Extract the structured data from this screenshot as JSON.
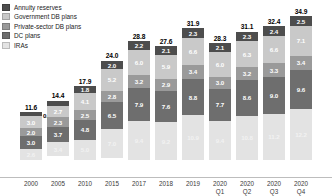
{
  "chart_data": {
    "type": "bar",
    "stacked": true,
    "title": "",
    "subtitle": "",
    "xlabel": "",
    "ylabel": "",
    "ylim": [
      0,
      34.9
    ],
    "grid": false,
    "legend_position": "top-left",
    "categories": [
      "2000",
      "2005",
      "2010",
      "2015",
      "2017",
      "2018",
      "2019",
      "2020\nQ1",
      "2020\nQ2",
      "2020\nQ3",
      "2020\nQ4"
    ],
    "tick_labels": [
      {
        "line1": "2000",
        "line2": ""
      },
      {
        "line1": "2005",
        "line2": ""
      },
      {
        "line1": "2010",
        "line2": ""
      },
      {
        "line1": "2015",
        "line2": ""
      },
      {
        "line1": "2017",
        "line2": ""
      },
      {
        "line1": "2018",
        "line2": ""
      },
      {
        "line1": "2019",
        "line2": ""
      },
      {
        "line1": "2020",
        "line2": "Q1"
      },
      {
        "line1": "2020",
        "line2": "Q2"
      },
      {
        "line1": "2020",
        "line2": "Q3"
      },
      {
        "line1": "2020",
        "line2": "Q4"
      }
    ],
    "totals": [
      11.6,
      14.4,
      17.9,
      24.0,
      28.8,
      27.6,
      31.9,
      28.3,
      31.1,
      32.4,
      34.9
    ],
    "series": [
      {
        "name": "Annuity reserves",
        "color": "#4d4d4d",
        "text_color": "#ffffff",
        "values": [
          0.9,
          1.4,
          1.8,
          2.0,
          2.2,
          2.1,
          2.3,
          2.1,
          2.3,
          2.4,
          2.5
        ]
      },
      {
        "name": "Government DB plans",
        "color": "#c9c9c9",
        "text_color": "#ffffff",
        "values": [
          3.0,
          2.7,
          4.1,
          5.2,
          6.0,
          5.9,
          6.6,
          6.0,
          6.3,
          6.6,
          7.1
        ]
      },
      {
        "name": "Private-sector DB plans",
        "color": "#9a9a9a",
        "text_color": "#ffffff",
        "values": [
          2.0,
          2.3,
          2.5,
          2.8,
          3.2,
          2.9,
          3.4,
          3.0,
          3.2,
          3.3,
          3.4
        ]
      },
      {
        "name": "DC plans",
        "color": "#6e6e6e",
        "text_color": "#ffffff",
        "values": [
          3.0,
          3.7,
          4.8,
          6.5,
          7.9,
          7.6,
          8.8,
          7.7,
          8.6,
          9.0,
          9.6
        ]
      },
      {
        "name": "IRAs",
        "color": "#e3e3e3",
        "text_color": "#f2f2f2",
        "values": [
          2.6,
          3.4,
          5.0,
          7.0,
          9.4,
          9.2,
          10.9,
          9.4,
          10.8,
          11.2,
          12.2
        ]
      }
    ],
    "labels": {
      "2000": {
        "total": "11.6",
        "annuity_outside": "0.9",
        "segments": [
          "",
          "3.0",
          "2.0",
          "3.0",
          "2.6"
        ]
      },
      "2005": {
        "total": "14.4",
        "annuity_outside": "",
        "segments": [
          "",
          "2.7",
          "2.3",
          "3.7",
          "3.4"
        ]
      },
      "2010": {
        "total": "17.9",
        "annuity_outside": "",
        "segments": [
          "1.8",
          "4.1",
          "2.5",
          "4.8",
          "5.0"
        ]
      },
      "2015": {
        "total": "24.0",
        "annuity_outside": "",
        "segments": [
          "2.0",
          "5.2",
          "2.8",
          "6.5",
          "7.0"
        ]
      },
      "2017": {
        "total": "28.8",
        "annuity_outside": "",
        "segments": [
          "2.2",
          "6.0",
          "3.2",
          "7.9",
          "9.4"
        ]
      },
      "2018": {
        "total": "27.6",
        "annuity_outside": "",
        "segments": [
          "2.1",
          "5.9",
          "2.9",
          "7.6",
          "9.2"
        ]
      },
      "2019": {
        "total": "31.9",
        "annuity_outside": "",
        "segments": [
          "2.3",
          "6.6",
          "3.4",
          "8.8",
          "10.9"
        ]
      },
      "2020Q1": {
        "total": "28.3",
        "annuity_outside": "",
        "segments": [
          "2.1",
          "6.0",
          "3.0",
          "7.7",
          "9.4"
        ]
      },
      "2020Q2": {
        "total": "31.1",
        "annuity_outside": "",
        "segments": [
          "2.3",
          "6.3",
          "3.2",
          "8.6",
          "10.8"
        ]
      },
      "2020Q3": {
        "total": "32.4",
        "annuity_outside": "",
        "segments": [
          "2.4",
          "6.6",
          "3.3",
          "9.0",
          "11.2"
        ]
      },
      "2020Q4": {
        "total": "34.9",
        "annuity_outside": "",
        "segments": [
          "2.5",
          "7.1",
          "3.4",
          "9.6",
          "12.2"
        ]
      }
    }
  },
  "legend": {
    "items": [
      {
        "label": "Annuity reserves",
        "color": "#4d4d4d"
      },
      {
        "label": "Government DB plans",
        "color": "#c9c9c9"
      },
      {
        "label": "Private-sector DB plans",
        "color": "#9a9a9a"
      },
      {
        "label": "DC plans",
        "color": "#6e6e6e"
      },
      {
        "label": "IRAs",
        "color": "#e3e3e3"
      }
    ]
  }
}
